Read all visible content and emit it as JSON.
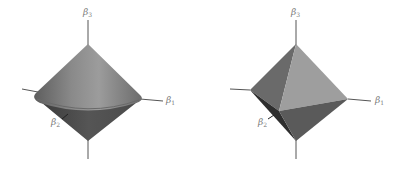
{
  "figures": [
    {
      "id": "ridge-constraint",
      "shape": "double cone (circular L2 ball)",
      "axes": {
        "b1": {
          "label": "β",
          "sub": "1"
        },
        "b2": {
          "label": "β",
          "sub": "2"
        },
        "b3": {
          "label": "β",
          "sub": "3"
        }
      }
    },
    {
      "id": "lasso-constraint",
      "shape": "octahedron (L1 ball)",
      "axes": {
        "b1": {
          "label": "β",
          "sub": "1"
        },
        "b2": {
          "label": "β",
          "sub": "2"
        },
        "b3": {
          "label": "β",
          "sub": "3"
        }
      }
    }
  ],
  "colors": {
    "background": "#ffffff",
    "axis": "#555555",
    "label": "#777777",
    "surface_light": "#9a9a9a",
    "surface_mid": "#7a7a7a",
    "surface_dark": "#4a4a4a",
    "surface_darkest": "#2e2e2e"
  }
}
